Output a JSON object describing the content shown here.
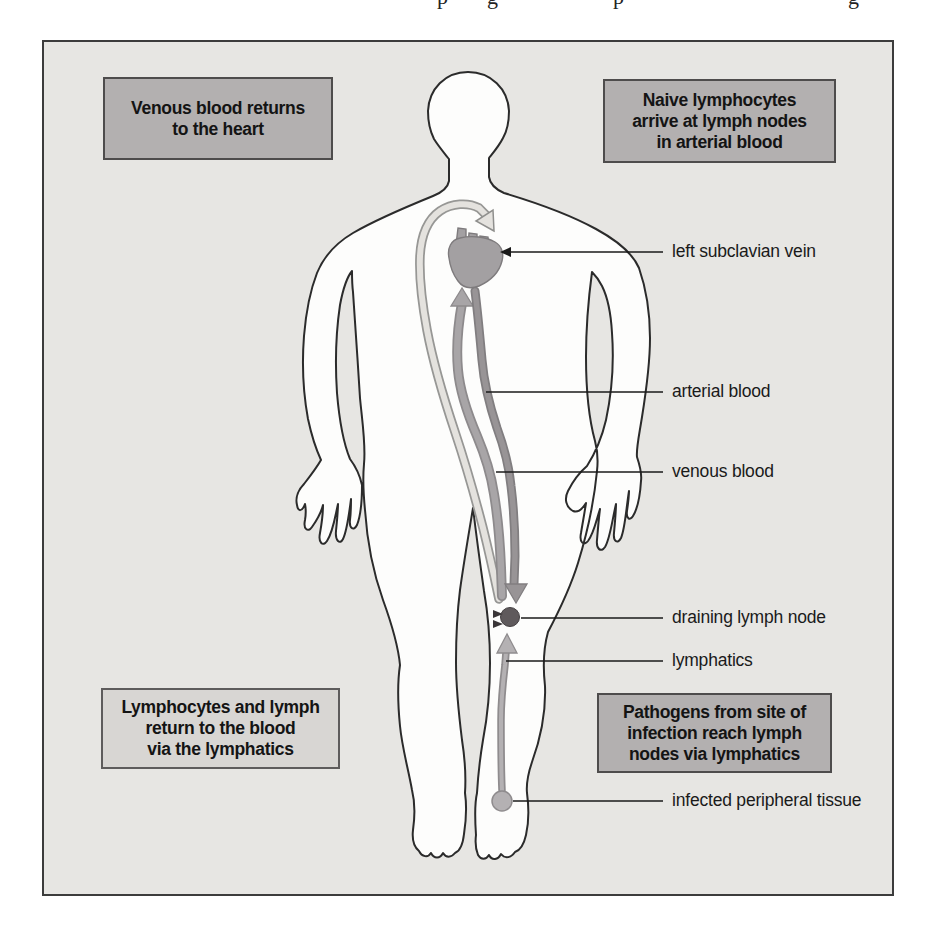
{
  "top_fragments": [
    {
      "ch": "p"
    },
    {
      "ch": "g"
    },
    {
      "ch": "p"
    },
    {
      "ch": "g"
    }
  ],
  "callout_boxes": {
    "top_left": {
      "lines": [
        "Venous blood returns",
        "to the heart"
      ]
    },
    "top_right": {
      "lines": [
        "Naive lymphocytes",
        "arrive at lymph nodes",
        "in arterial blood"
      ]
    },
    "bottom_left": {
      "lines": [
        "Lymphocytes and lymph",
        "return to the blood",
        "via the lymphatics"
      ]
    },
    "bottom_right": {
      "lines": [
        "Pathogens from site of",
        "infection reach lymph",
        "nodes via lymphatics"
      ]
    }
  },
  "labels": {
    "subclavian": "left subclavian vein",
    "arterial": "arterial blood",
    "venous": "venous blood",
    "node": "draining lymph node",
    "lymphatics": "lymphatics",
    "infected": "infected peripheral tissue"
  },
  "colors": {
    "panel_background": "#e7e6e3",
    "callout_dark": "#b3b0b0",
    "callout_light": "#d8d6d3",
    "body_fill": "#fdfdfc",
    "outline": "#2b2b2b",
    "heart": "#a3a0a2",
    "venous_vessel": "#a8a5a7",
    "arterial_vessel": "#989496",
    "lymphatic_vessel": "#e4e2de",
    "lymph_node": "#5f5a5c",
    "infected_tissue": "#b4b1b3",
    "leader_line": "#1a1a1a"
  }
}
